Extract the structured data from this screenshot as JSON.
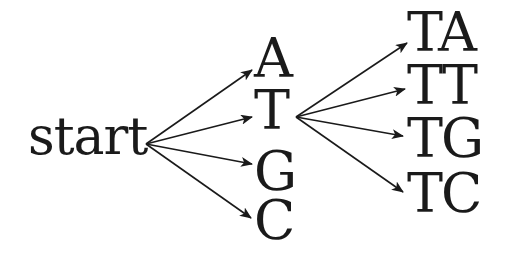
{
  "diagram": {
    "type": "tree",
    "root": {
      "label": "start"
    },
    "level1": [
      {
        "label": "A"
      },
      {
        "label": "T"
      },
      {
        "label": "G"
      },
      {
        "label": "C"
      }
    ],
    "level2_from_T": [
      {
        "label": "TA"
      },
      {
        "label": "TT"
      },
      {
        "label": "TG"
      },
      {
        "label": "TC"
      }
    ],
    "edges": [
      {
        "from": "start",
        "to": "A"
      },
      {
        "from": "start",
        "to": "T"
      },
      {
        "from": "start",
        "to": "G"
      },
      {
        "from": "start",
        "to": "C"
      },
      {
        "from": "T",
        "to": "TA"
      },
      {
        "from": "T",
        "to": "TT"
      },
      {
        "from": "T",
        "to": "TG"
      },
      {
        "from": "T",
        "to": "TC"
      }
    ],
    "colors": {
      "stroke": "#1a1a1a",
      "background": "#ffffff"
    }
  }
}
